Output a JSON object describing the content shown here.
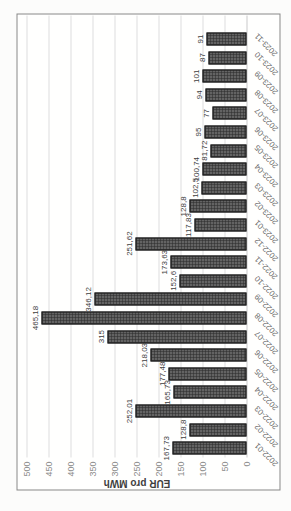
{
  "chart_data": {
    "type": "bar",
    "title": "",
    "xlabel": "",
    "ylabel": "EUR pro MWh",
    "ylim": [
      0,
      500
    ],
    "ytick_interval": 50,
    "grid": "on",
    "legend": "none",
    "displayed_rotation": "whole chart rotated 90deg counterclockwise in screenshot",
    "categories": [
      "2022-01",
      "2022-02",
      "2022-03",
      "2022-04",
      "2022-05",
      "2022-06",
      "2022-07",
      "2022-08",
      "2022-09",
      "2022-10",
      "2022-11",
      "2022-12",
      "2023-01",
      "2023-02",
      "2023-03",
      "2023-04",
      "2023-05",
      "2023-06",
      "2023-07",
      "2023-08",
      "2023-09",
      "2023-10",
      "2023-11"
    ],
    "values": [
      167.73,
      128.8,
      252.01,
      165.73,
      177.48,
      218.03,
      315,
      465.18,
      346.12,
      152.6,
      173.63,
      251.62,
      117.83,
      128.8,
      102.5,
      100.74,
      81.72,
      95,
      77,
      94,
      101,
      87,
      91
    ],
    "value_labels": [
      "167,73",
      "128,8",
      "252,01",
      "165,73",
      "177,48",
      "218,03",
      "315",
      "465,18",
      "346,12",
      "152,6",
      "173,63",
      "251,62",
      "117,83",
      "128,8",
      "102,5",
      "100,74",
      "81,72",
      "95",
      "77",
      "94",
      "101",
      "87",
      "91"
    ],
    "colors": {
      "bar_fill": "#383838",
      "bar_pattern_dots": "#ababab",
      "bar_border": "#1a1a1a",
      "gridline": "#dedede",
      "axis_zero_line": "#c9c9c9",
      "frame_border": "#878787",
      "tick_text": "#8b8b8b",
      "category_text": "#666666",
      "value_text": "#3e3e3e",
      "background": "#fffffe"
    }
  }
}
